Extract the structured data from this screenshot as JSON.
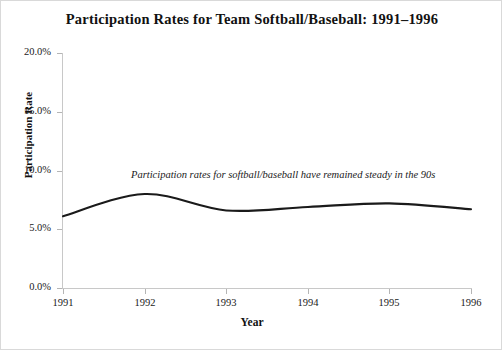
{
  "chart_data": {
    "type": "line",
    "title": "Participation Rates for Team Softball/Baseball: 1991–1996",
    "xlabel": "Year",
    "ylabel": "Participation Rate",
    "categories": [
      "1991",
      "1992",
      "1993",
      "1994",
      "1995",
      "1996"
    ],
    "x": [
      1991,
      1992,
      1993,
      1994,
      1995,
      1996
    ],
    "series": [
      {
        "name": "Participation Rate",
        "values": [
          6.1,
          8.0,
          6.6,
          6.9,
          7.2,
          6.7
        ],
        "color": "#1a1a1a"
      }
    ],
    "ylim": [
      0.0,
      20.0
    ],
    "xlim": [
      1991,
      1996
    ],
    "ytick_labels": [
      "0.0%",
      "5.0%",
      "10.0%",
      "15.0%",
      "20.0%"
    ],
    "ytick_values": [
      0.0,
      5.0,
      10.0,
      15.0,
      20.0
    ],
    "xtick_labels": [
      "1991",
      "1992",
      "1993",
      "1994",
      "1995",
      "1996"
    ],
    "grid": false,
    "legend": "none",
    "annotations": [
      {
        "text": "Participation rates for softball/baseball have remained steady in the 90s",
        "style": "italic"
      }
    ],
    "axis_color": "#c8c8c8",
    "background_color": "#ffffff"
  },
  "figure": {
    "title": "Participation Rates for Team Softball/Baseball: 1991–1996",
    "annotation": "Participation rates for softball/baseball have remained steady in the 90s",
    "y_axis_title": "Participation Rate",
    "x_axis_title": "Year",
    "y_ticks": [
      "20.0%",
      "15.0%",
      "10.0%",
      "5.0%",
      "0.0%"
    ],
    "x_ticks": [
      "1991",
      "1992",
      "1993",
      "1994",
      "1995",
      "1996"
    ]
  }
}
